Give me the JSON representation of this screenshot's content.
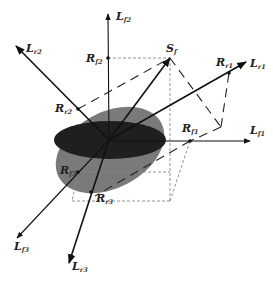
{
  "figure": {
    "type": "3d-vector-diagram",
    "colors": {
      "ellipse_dark": "#1f1f1f",
      "ellipse_light": "#7a7a7a",
      "axis": "#111111",
      "dashed_box": "#888888",
      "background": "#ffffff"
    },
    "origin": {
      "x": 109,
      "y": 140
    },
    "vectors": [
      {
        "id": "Lf2",
        "main": "L",
        "sub": "f2",
        "tip": [
          108,
          14
        ],
        "label_pos": [
          116,
          20
        ]
      },
      {
        "id": "Lr2",
        "main": "L",
        "sub": "r2",
        "tip": [
          16,
          46
        ],
        "label_pos": [
          26,
          52
        ]
      },
      {
        "id": "Sf",
        "main": "S",
        "sub": "f",
        "tip": [
          170,
          58
        ],
        "label_pos": [
          166,
          52
        ]
      },
      {
        "id": "Lr1",
        "main": "L",
        "sub": "r1",
        "tip": [
          246,
          62
        ],
        "label_pos": [
          250,
          67
        ]
      },
      {
        "id": "Lf1",
        "main": "L",
        "sub": "f1",
        "tip": [
          250,
          141
        ],
        "label_pos": [
          250,
          134
        ]
      },
      {
        "id": "Lf3",
        "main": "L",
        "sub": "f3",
        "tip": [
          17,
          238
        ],
        "label_pos": [
          14,
          250
        ]
      },
      {
        "id": "Lr3",
        "main": "L",
        "sub": "r3",
        "tip": [
          69,
          263
        ],
        "label_pos": [
          72,
          270
        ]
      }
    ],
    "points": [
      {
        "id": "Rf2",
        "main": "R",
        "sub": "f2",
        "pos": [
          108,
          58
        ],
        "label_pos": [
          86,
          62
        ]
      },
      {
        "id": "Rr2",
        "main": "R",
        "sub": "r2",
        "pos": [
          78,
          109
        ],
        "label_pos": [
          55,
          112
        ]
      },
      {
        "id": "Rr1",
        "main": "R",
        "sub": "r1",
        "pos": [
          229,
          73
        ],
        "label_pos": [
          216,
          66
        ]
      },
      {
        "id": "Rf1",
        "main": "R",
        "sub": "f1",
        "pos": [
          190,
          141
        ],
        "label_pos": [
          182,
          132
        ]
      },
      {
        "id": "Rf3",
        "main": "R",
        "sub": "f3",
        "pos": [
          78,
          172
        ],
        "label_pos": [
          60,
          174
        ]
      },
      {
        "id": "Rr3",
        "main": "R",
        "sub": "r3",
        "pos": [
          91,
          192
        ],
        "label_pos": [
          96,
          202
        ]
      }
    ]
  }
}
